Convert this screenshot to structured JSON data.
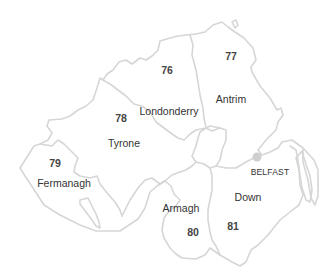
{
  "map": {
    "title": "Northern Ireland counties",
    "counties": [
      {
        "name": "Londonderry",
        "value": "76",
        "label_pos": [
          169,
          111
        ],
        "value_pos": [
          167,
          70
        ]
      },
      {
        "name": "Antrim",
        "value": "77",
        "label_pos": [
          231,
          99
        ],
        "value_pos": [
          231,
          56
        ]
      },
      {
        "name": "Tyrone",
        "value": "78",
        "label_pos": [
          124,
          143
        ],
        "value_pos": [
          121,
          118
        ]
      },
      {
        "name": "Fermanagh",
        "value": "79",
        "label_pos": [
          64,
          183
        ],
        "value_pos": [
          55,
          163
        ]
      },
      {
        "name": "Armagh",
        "value": "80",
        "label_pos": [
          181,
          208
        ],
        "value_pos": [
          193,
          232
        ]
      },
      {
        "name": "Down",
        "value": "81",
        "label_pos": [
          248,
          197
        ],
        "value_pos": [
          233,
          226
        ]
      }
    ],
    "cities": [
      {
        "name": "BELFAST",
        "label_pos": [
          270,
          172
        ],
        "dot_pos": [
          257,
          157
        ]
      }
    ],
    "colors": {
      "border": "#d6d6d6",
      "text": "#333333",
      "city_dot": "#cfcfcf",
      "background": "#ffffff"
    }
  }
}
